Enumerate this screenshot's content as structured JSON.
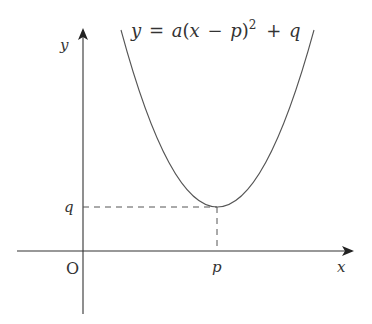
{
  "diagram": {
    "type": "quadratic-function-graph",
    "equation": {
      "y": "y",
      "eq": "=",
      "a": "a",
      "open": "(",
      "x": "x",
      "minus": "−",
      "p": "p",
      "close": ")",
      "exp": "2",
      "plus": "+",
      "q": "q"
    },
    "axes": {
      "x_label": "x",
      "y_label": "y",
      "origin_label": "O"
    },
    "vertex": {
      "x_label": "p",
      "y_label": "q"
    },
    "colors": {
      "axis": "#333333",
      "curve": "#555555",
      "dashed": "#555555",
      "text": "#333333"
    }
  }
}
